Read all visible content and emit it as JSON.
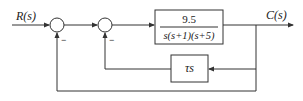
{
  "diagram": {
    "type": "control-system-block-diagram",
    "input_label": "R(s)",
    "output_label": "C(s)",
    "forward_block": {
      "numerator": "9.5",
      "denominator": "s(s+1)(s+5)"
    },
    "feedback_block": {
      "label": "τs"
    },
    "summing_junctions": [
      {
        "id": "sum1",
        "inputs": [
          "+",
          "−"
        ]
      },
      {
        "id": "sum2",
        "inputs": [
          "+",
          "−"
        ]
      }
    ],
    "signs": {
      "sum1_minus": "−",
      "sum2_minus": "−"
    },
    "colors": {
      "line": "#333333",
      "text": "#222222",
      "background": "#ffffff"
    }
  }
}
